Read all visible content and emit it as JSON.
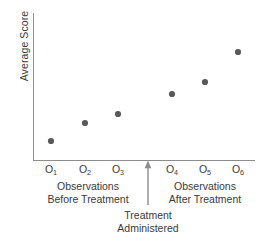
{
  "chart_data": {
    "type": "scatter",
    "title": "",
    "subtitle": "",
    "xlabel": "",
    "ylabel": "Average Score",
    "categories": [
      "O1",
      "O2",
      "O3",
      "O4",
      "O5",
      "O6"
    ],
    "tick_labels": [
      {
        "base": "O",
        "sub": "1"
      },
      {
        "base": "O",
        "sub": "2"
      },
      {
        "base": "O",
        "sub": "3"
      },
      {
        "base": "O",
        "sub": "4"
      },
      {
        "base": "O",
        "sub": "5"
      },
      {
        "base": "O",
        "sub": "6"
      }
    ],
    "values": [
      18,
      31,
      37,
      51,
      60,
      80
    ],
    "points": [
      {
        "label": "O1",
        "x_px": 51,
        "y_px": 141,
        "value": 18
      },
      {
        "label": "O2",
        "x_px": 85,
        "y_px": 123,
        "value": 31
      },
      {
        "label": "O3",
        "x_px": 118,
        "y_px": 114,
        "value": 37
      },
      {
        "label": "O4",
        "x_px": 172,
        "y_px": 94,
        "value": 51
      },
      {
        "label": "O5",
        "x_px": 205,
        "y_px": 82,
        "value": 60
      },
      {
        "label": "O6",
        "x_px": 238,
        "y_px": 52,
        "value": 80
      }
    ],
    "ylim": [
      0,
      100
    ],
    "grid": false,
    "legend": "none",
    "marker_color": "#595959",
    "axis_color": "#8d8d8d",
    "text_color": "#3a3a3a",
    "annotations": [
      {
        "name": "before-group",
        "line1": "Observations",
        "line2": "Before Treatment"
      },
      {
        "name": "after-group",
        "line1": "Observations",
        "line2": "After Treatment"
      },
      {
        "name": "treatment-marker",
        "line1": "Treatment",
        "line2": "Administered"
      }
    ]
  },
  "axis": {
    "y_label": "Average Score"
  },
  "captions": {
    "before": {
      "line1": "Observations",
      "line2": "Before Treatment"
    },
    "after": {
      "line1": "Observations",
      "line2": "After Treatment"
    },
    "treatment": {
      "line1": "Treatment",
      "line2": "Administered"
    }
  }
}
